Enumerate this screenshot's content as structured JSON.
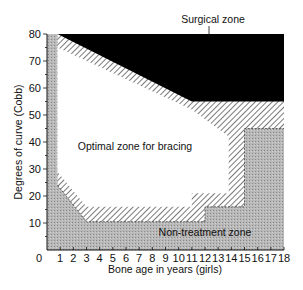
{
  "chart_data": {
    "type": "area",
    "title": "",
    "xlabel": "Bone age in years (girls)",
    "ylabel": "Degrees of curve (Cobb)",
    "xlim": [
      0,
      18
    ],
    "ylim": [
      0,
      80
    ],
    "x_ticks": [
      0,
      1,
      2,
      3,
      4,
      5,
      6,
      7,
      8,
      9,
      10,
      11,
      12,
      13,
      14,
      15,
      16,
      17,
      18
    ],
    "y_ticks": [
      10,
      20,
      30,
      40,
      50,
      60,
      70,
      80
    ],
    "grid": false,
    "zones": [
      {
        "name": "Surgical zone",
        "fill": "black",
        "polygon": [
          [
            0.8,
            80
          ],
          [
            18,
            80
          ],
          [
            18,
            55
          ],
          [
            11,
            55
          ],
          [
            0.8,
            80
          ]
        ]
      },
      {
        "name": "Optimal zone for bracing",
        "fill": "white",
        "polygon": [
          [
            0.8,
            75
          ],
          [
            11,
            52
          ],
          [
            13.8,
            42
          ],
          [
            13.8,
            21
          ],
          [
            11,
            21
          ],
          [
            11,
            16
          ],
          [
            3,
            16
          ],
          [
            0.8,
            29
          ]
        ]
      },
      {
        "name": "Non-treatment zone",
        "fill": "grey-stipple",
        "polygon": [
          [
            0,
            80
          ],
          [
            0.8,
            80
          ],
          [
            0.8,
            24
          ],
          [
            3,
            10.5
          ],
          [
            12,
            10.5
          ],
          [
            12,
            16
          ],
          [
            15,
            16
          ],
          [
            15,
            45
          ],
          [
            18,
            45
          ],
          [
            18,
            0
          ],
          [
            0,
            0
          ]
        ]
      },
      {
        "name": "Transition (hatched) band",
        "fill": "diagonal-hatch",
        "description": "Borderline region between zones"
      }
    ],
    "annotations": [
      "Surgical zone",
      "Optimal zone for bracing",
      "Non-treatment zone"
    ]
  },
  "labels": {
    "surgical": "Surgical zone",
    "optimal": "Optimal zone for bracing",
    "nontreatment": "Non-treatment zone",
    "xlabel": "Bone age in years (girls)",
    "ylabel": "Degrees of curve (Cobb)"
  }
}
